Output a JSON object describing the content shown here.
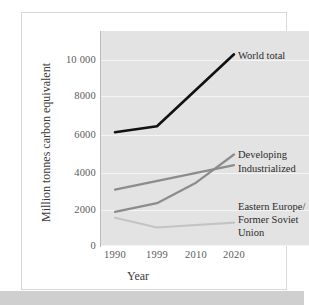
{
  "chart_data": {
    "type": "line",
    "title": "",
    "xlabel": "Year",
    "ylabel": "Million tonnes carbon equivalent",
    "x": [
      1990,
      1999,
      2010,
      2020
    ],
    "xtick_labels": [
      "1990",
      "1999",
      "2010",
      "2020"
    ],
    "ytick_labels": [
      "0",
      "2000",
      "4000",
      "6000",
      "8000",
      "10 000"
    ],
    "ytick_values": [
      0,
      2000,
      4000,
      6000,
      8000,
      10000
    ],
    "ylim": [
      0,
      11000
    ],
    "grid": true,
    "legend_position": "inline-right-of-line-ends",
    "plot_background": "#e3e3e3",
    "series": [
      {
        "name": "World total",
        "color": "#111111",
        "width": 2.6,
        "x": [
          1990,
          1999,
          2020
        ],
        "values": [
          5800,
          6100,
          9800
        ]
      },
      {
        "name": "Developing",
        "color": "#8c8c8c",
        "width": 2.2,
        "x": [
          1990,
          1999,
          2010,
          2020
        ],
        "values": [
          1700,
          2150,
          3200,
          4650
        ]
      },
      {
        "name": "Industrialized",
        "color": "#8c8c8c",
        "width": 2.2,
        "x": [
          1990,
          2020
        ],
        "values": [
          2850,
          4100
        ]
      },
      {
        "name": "Eastern Europe/ Former Soviet Union",
        "color": "#c4c4c4",
        "width": 2.2,
        "x": [
          1990,
          1999,
          2020
        ],
        "values": [
          1400,
          900,
          1150
        ]
      }
    ],
    "annotations": [
      {
        "text": "World total",
        "series": "World total"
      },
      {
        "text": "Developing",
        "series": "Developing"
      },
      {
        "text": "Industrialized",
        "series": "Industrialized"
      },
      {
        "text": "Eastern Europe/",
        "series": "Eastern Europe/ Former Soviet Union"
      },
      {
        "text": "Former Soviet",
        "series": "Eastern Europe/ Former Soviet Union"
      },
      {
        "text": "Union",
        "series": "Eastern Europe/ Former Soviet Union"
      }
    ]
  },
  "axes": {
    "ytick_0": "0",
    "ytick_1": "2000",
    "ytick_2": "4000",
    "ytick_3": "6000",
    "ytick_4": "8000",
    "ytick_5": "10 000",
    "xtick_0": "1990",
    "xtick_1": "1999",
    "xtick_2": "2010",
    "xtick_3": "2020",
    "x_title": "Year",
    "y_title": "Million tonnes carbon equivalent"
  },
  "labels": {
    "world_total": "World total",
    "developing": "Developing",
    "industrialized": "Industrialized",
    "eastern_europe_line1": "Eastern Europe/",
    "eastern_europe_line2": "Former Soviet",
    "eastern_europe_line3": "Union"
  },
  "colors": {
    "world_total": "#111111",
    "developing": "#8c8c8c",
    "industrialized": "#8c8c8c",
    "eastern_europe": "#c4c4c4",
    "panel": "#e3e3e3",
    "gridline": "#f4f4f4",
    "card": "#ffffff"
  }
}
